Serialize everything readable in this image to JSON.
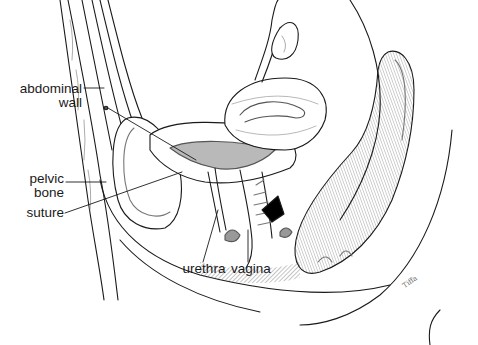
{
  "diagram": {
    "type": "anatomical-illustration",
    "view": "sagittal section of female pelvis",
    "style": "black-and-white line art",
    "colors": {
      "ink": "#1a1a1a",
      "background": "#ffffff",
      "shade": "#b9b9b9",
      "dark_fill": "#000000"
    },
    "labels": [
      {
        "id": "abdominal-wall",
        "lines": [
          "abdominal",
          "wall"
        ]
      },
      {
        "id": "pelvic-bone",
        "lines": [
          "pelvic",
          "bone"
        ]
      },
      {
        "id": "suture",
        "lines": [
          "suture"
        ]
      },
      {
        "id": "urethra",
        "lines": [
          "urethra"
        ]
      },
      {
        "id": "vagina",
        "lines": [
          "vagina"
        ]
      }
    ],
    "signature": "Tiffa"
  }
}
